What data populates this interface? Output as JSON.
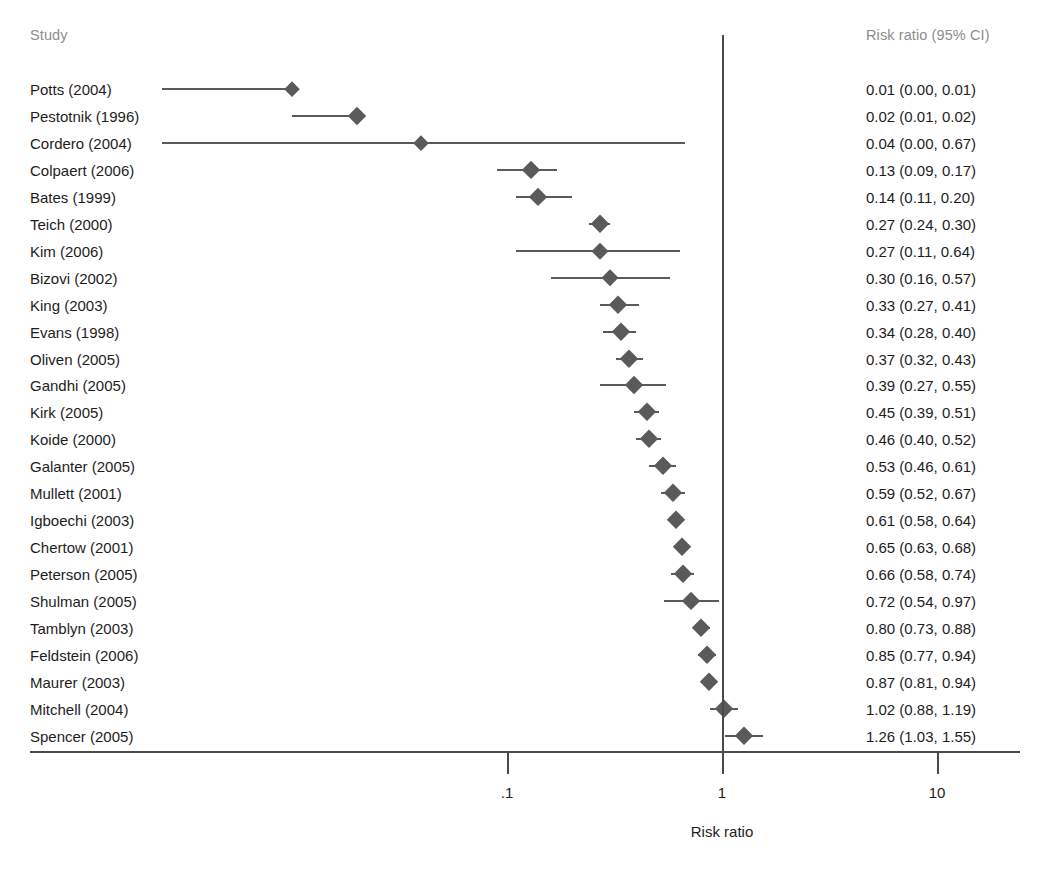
{
  "header": {
    "study_col": "Study",
    "estimate_col": "Risk ratio (95% CI)"
  },
  "axis": {
    "title": "Risk ratio",
    "tick_labels": [
      ".1",
      "1",
      "10"
    ],
    "tick_values": [
      0.1,
      1,
      10
    ],
    "null_value": 1
  },
  "colors": {
    "marker": "#5a5a5a",
    "line": "#5a5a5a",
    "axis": "#4a4a4a",
    "header_text": "#8d8d8d",
    "body_text": "#1d1d1d",
    "background": "#ffffff"
  },
  "chart_data": {
    "type": "forest",
    "title": "",
    "xlabel": "Risk ratio",
    "ylabel": "Study",
    "xscale": "log",
    "xlim": [
      0.008,
      20
    ],
    "xticks": [
      0.1,
      1,
      10
    ],
    "xticklabels": [
      ".1",
      "1",
      "10"
    ],
    "grid": false,
    "legend": "none",
    "null_line": 1,
    "columns": [
      "Study",
      "Risk ratio (95% CI)"
    ],
    "rows": [
      {
        "study": "Potts (2004)",
        "estimate": 0.01,
        "lower": 0.0,
        "upper": 0.01,
        "label": "0.01 (0.00, 0.01)"
      },
      {
        "study": "Pestotnik (1996)",
        "estimate": 0.02,
        "lower": 0.01,
        "upper": 0.02,
        "label": "0.02 (0.01, 0.02)"
      },
      {
        "study": "Cordero (2004)",
        "estimate": 0.04,
        "lower": 0.0,
        "upper": 0.67,
        "label": "0.04 (0.00, 0.67)"
      },
      {
        "study": "Colpaert (2006)",
        "estimate": 0.13,
        "lower": 0.09,
        "upper": 0.17,
        "label": "0.13 (0.09, 0.17)"
      },
      {
        "study": "Bates (1999)",
        "estimate": 0.14,
        "lower": 0.11,
        "upper": 0.2,
        "label": "0.14 (0.11, 0.20)"
      },
      {
        "study": "Teich (2000)",
        "estimate": 0.27,
        "lower": 0.24,
        "upper": 0.3,
        "label": "0.27 (0.24, 0.30)"
      },
      {
        "study": "Kim (2006)",
        "estimate": 0.27,
        "lower": 0.11,
        "upper": 0.64,
        "label": "0.27 (0.11, 0.64)"
      },
      {
        "study": "Bizovi (2002)",
        "estimate": 0.3,
        "lower": 0.16,
        "upper": 0.57,
        "label": "0.30 (0.16, 0.57)"
      },
      {
        "study": "King (2003)",
        "estimate": 0.33,
        "lower": 0.27,
        "upper": 0.41,
        "label": "0.33 (0.27, 0.41)"
      },
      {
        "study": "Evans (1998)",
        "estimate": 0.34,
        "lower": 0.28,
        "upper": 0.4,
        "label": "0.34 (0.28, 0.40)"
      },
      {
        "study": "Oliven (2005)",
        "estimate": 0.37,
        "lower": 0.32,
        "upper": 0.43,
        "label": "0.37 (0.32, 0.43)"
      },
      {
        "study": "Gandhi (2005)",
        "estimate": 0.39,
        "lower": 0.27,
        "upper": 0.55,
        "label": "0.39 (0.27, 0.55)"
      },
      {
        "study": "Kirk (2005)",
        "estimate": 0.45,
        "lower": 0.39,
        "upper": 0.51,
        "label": "0.45 (0.39, 0.51)"
      },
      {
        "study": "Koide (2000)",
        "estimate": 0.46,
        "lower": 0.4,
        "upper": 0.52,
        "label": "0.46 (0.40, 0.52)"
      },
      {
        "study": "Galanter (2005)",
        "estimate": 0.53,
        "lower": 0.46,
        "upper": 0.61,
        "label": "0.53 (0.46, 0.61)"
      },
      {
        "study": "Mullett (2001)",
        "estimate": 0.59,
        "lower": 0.52,
        "upper": 0.67,
        "label": "0.59 (0.52, 0.67)"
      },
      {
        "study": "Igboechi (2003)",
        "estimate": 0.61,
        "lower": 0.58,
        "upper": 0.64,
        "label": "0.61 (0.58, 0.64)"
      },
      {
        "study": "Chertow (2001)",
        "estimate": 0.65,
        "lower": 0.63,
        "upper": 0.68,
        "label": "0.65 (0.63, 0.68)"
      },
      {
        "study": "Peterson (2005)",
        "estimate": 0.66,
        "lower": 0.58,
        "upper": 0.74,
        "label": "0.66 (0.58, 0.74)"
      },
      {
        "study": "Shulman (2005)",
        "estimate": 0.72,
        "lower": 0.54,
        "upper": 0.97,
        "label": "0.72 (0.54, 0.97)"
      },
      {
        "study": "Tamblyn (2003)",
        "estimate": 0.8,
        "lower": 0.73,
        "upper": 0.88,
        "label": "0.80 (0.73, 0.88)"
      },
      {
        "study": "Feldstein (2006)",
        "estimate": 0.85,
        "lower": 0.77,
        "upper": 0.94,
        "label": "0.85 (0.77, 0.94)"
      },
      {
        "study": "Maurer (2003)",
        "estimate": 0.87,
        "lower": 0.81,
        "upper": 0.94,
        "label": "0.87 (0.81, 0.94)"
      },
      {
        "study": "Mitchell (2004)",
        "estimate": 1.02,
        "lower": 0.88,
        "upper": 1.19,
        "label": "1.02 (0.88, 1.19)"
      },
      {
        "study": "Spencer (2005)",
        "estimate": 1.26,
        "lower": 1.03,
        "upper": 1.55,
        "label": "1.26 (1.03, 1.55)"
      }
    ]
  }
}
